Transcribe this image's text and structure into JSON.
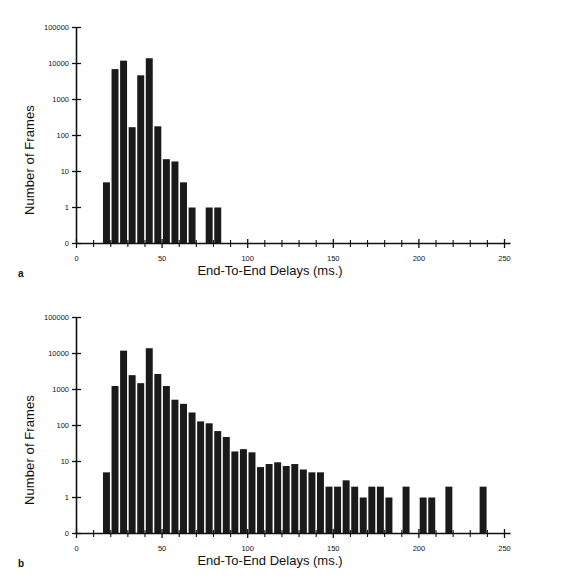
{
  "figure": {
    "background": "#ffffff",
    "bar_color": "#1a1a1a",
    "axis_color": "#111111"
  },
  "panels": [
    {
      "tag": "a",
      "xlabel": "End-To-End Delays (ms.)",
      "ylabel": "Number of Frames"
    },
    {
      "tag": "b",
      "xlabel": "End-To-End Delays (ms.)",
      "ylabel": "Number of Frames"
    }
  ],
  "chart_data": [
    {
      "type": "bar",
      "title": "",
      "panel": "a",
      "xlabel": "End-To-End Delays (ms.)",
      "ylabel": "Number of Frames",
      "yscale": "log",
      "ylim": [
        0,
        100000
      ],
      "xlim": [
        0,
        250
      ],
      "grid": false,
      "legend": null,
      "ytick_labels": [
        "0",
        "1",
        "10",
        "100",
        "1000",
        "10000",
        "100000"
      ],
      "ytick_values": [
        0,
        1,
        10,
        100,
        1000,
        10000,
        100000
      ],
      "xtick_labels": [
        "0",
        "50",
        "100",
        "150",
        "200",
        "250"
      ],
      "xtick_values": [
        0,
        50,
        100,
        150,
        200,
        250
      ],
      "xtick_minor_step": 10,
      "bin_width": 5,
      "bin_centers": [
        17.5,
        22.5,
        27.5,
        32.5,
        37.5,
        42.5,
        47.5,
        52.5,
        57.5,
        62.5,
        67.5,
        72.5,
        77.5,
        82.5
      ],
      "values": [
        5,
        7000,
        12000,
        170,
        4700,
        14000,
        180,
        22,
        19,
        5,
        1,
        0,
        1,
        1
      ]
    },
    {
      "type": "bar",
      "title": "",
      "panel": "b",
      "xlabel": "End-To-End Delays (ms.)",
      "ylabel": "Number of Frames",
      "yscale": "log",
      "ylim": [
        0,
        100000
      ],
      "xlim": [
        0,
        250
      ],
      "grid": false,
      "legend": null,
      "ytick_labels": [
        "0",
        "1",
        "10",
        "100",
        "1000",
        "10000",
        "100000"
      ],
      "ytick_values": [
        0,
        1,
        10,
        100,
        1000,
        10000,
        100000
      ],
      "xtick_labels": [
        "0",
        "50",
        "100",
        "150",
        "200",
        "250"
      ],
      "xtick_values": [
        0,
        50,
        100,
        150,
        200,
        250
      ],
      "xtick_minor_step": 10,
      "bin_width": 5,
      "bin_centers": [
        17.5,
        22.5,
        27.5,
        32.5,
        37.5,
        42.5,
        47.5,
        52.5,
        57.5,
        62.5,
        67.5,
        72.5,
        77.5,
        82.5,
        87.5,
        92.5,
        97.5,
        102.5,
        107.5,
        112.5,
        117.5,
        122.5,
        127.5,
        132.5,
        137.5,
        142.5,
        147.5,
        152.5,
        157.5,
        162.5,
        167.5,
        172.5,
        177.5,
        182.5,
        187.5,
        192.5,
        197.5,
        202.5,
        207.5,
        212.5,
        217.5,
        222.5,
        227.5,
        232.5,
        237.5
      ],
      "values": [
        5,
        1250,
        12000,
        2500,
        1500,
        14000,
        2700,
        1250,
        520,
        400,
        230,
        130,
        115,
        70,
        48,
        19,
        22,
        18,
        7,
        8.5,
        9.5,
        7.5,
        8.5,
        6,
        5,
        5,
        2,
        2,
        3,
        2,
        1,
        2,
        2,
        1,
        0,
        2,
        0,
        1,
        1,
        0,
        2,
        0,
        0,
        0,
        2
      ]
    }
  ]
}
